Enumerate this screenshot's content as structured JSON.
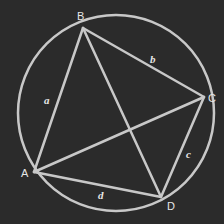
{
  "diagram": {
    "colors": {
      "background": "#2b2b2b",
      "stroke": "#c8c8c8",
      "text": "#e6e6e6"
    },
    "circle": {
      "cx": 116,
      "cy": 113,
      "r": 98
    },
    "vertices": [
      {
        "id": "A",
        "label": "A",
        "x": 34,
        "y": 172,
        "lx": 21,
        "ly": 177
      },
      {
        "id": "B",
        "label": "B",
        "x": 83,
        "y": 28,
        "lx": 77,
        "ly": 20
      },
      {
        "id": "C",
        "label": "C",
        "x": 204,
        "y": 97,
        "lx": 208,
        "ly": 102
      },
      {
        "id": "D",
        "label": "D",
        "x": 161,
        "y": 197,
        "lx": 167,
        "ly": 210
      }
    ],
    "sides": [
      {
        "label": "a",
        "from": "A",
        "to": "B",
        "lx": 44,
        "ly": 104
      },
      {
        "label": "b",
        "from": "B",
        "to": "C",
        "lx": 150,
        "ly": 63
      },
      {
        "label": "c",
        "from": "C",
        "to": "D",
        "lx": 186,
        "ly": 158
      },
      {
        "label": "d",
        "from": "D",
        "to": "A",
        "lx": 98,
        "ly": 199
      }
    ],
    "diagonals": [
      {
        "from": "A",
        "to": "C"
      },
      {
        "from": "B",
        "to": "D"
      }
    ]
  }
}
